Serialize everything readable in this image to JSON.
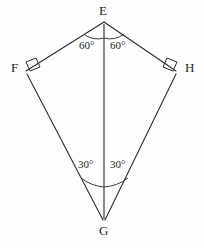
{
  "figure": {
    "type": "geometry-diagram",
    "shape_name": "kite EFGH",
    "background_color": "#fefefe",
    "stroke_color": "#2b2b2b",
    "vertices": [
      {
        "id": "E",
        "label": "E",
        "x": 104,
        "y": 22,
        "position": "apex-top"
      },
      {
        "id": "F",
        "label": "F",
        "x": 25,
        "y": 71,
        "position": "left"
      },
      {
        "id": "H",
        "label": "H",
        "x": 177,
        "y": 71,
        "position": "right"
      },
      {
        "id": "G",
        "label": "G",
        "x": 104,
        "y": 220,
        "position": "apex-bottom"
      }
    ],
    "edges": [
      {
        "from": "E",
        "to": "F"
      },
      {
        "from": "E",
        "to": "H"
      },
      {
        "from": "F",
        "to": "G"
      },
      {
        "from": "H",
        "to": "G"
      }
    ],
    "diagonal": {
      "from": "E",
      "to": "G"
    },
    "angle_labels": [
      {
        "id": "angle-e-left",
        "vertex": "E",
        "side": "left",
        "text": "60°",
        "value": 60
      },
      {
        "id": "angle-e-right",
        "vertex": "E",
        "side": "right",
        "text": "60°",
        "value": 60
      },
      {
        "id": "angle-g-left",
        "vertex": "G",
        "side": "left",
        "text": "30°",
        "value": 30
      },
      {
        "id": "angle-g-right",
        "vertex": "G",
        "side": "right",
        "text": "30°",
        "value": 30
      }
    ],
    "right_angle_marks": [
      {
        "vertex": "F",
        "label": "right-angle-square"
      },
      {
        "vertex": "H",
        "label": "right-angle-square"
      }
    ]
  }
}
